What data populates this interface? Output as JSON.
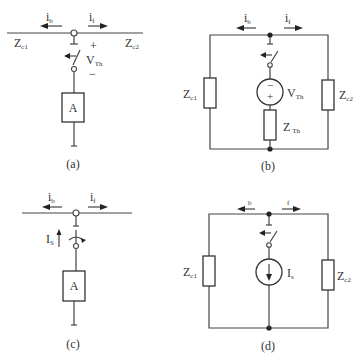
{
  "panels": {
    "a": {
      "caption": "(a)",
      "labels": {
        "ib": "i",
        "ib_sub": "b",
        "if": "i",
        "if_sub": "f",
        "zc1": "Z",
        "zc1_sub": "c1",
        "zc2": "Z",
        "zc2_sub": "c2",
        "vth": "V",
        "vth_sub": "Th",
        "plus": "+",
        "minus": "−",
        "box": "A"
      }
    },
    "b": {
      "caption": "(b)",
      "labels": {
        "ib": "i",
        "ib_sub": "b",
        "if": "i",
        "if_sub": "f",
        "zc1": "Z",
        "zc1_sub": "c1",
        "zc2": "Z",
        "zc2_sub": "c2",
        "vth": "V",
        "vth_sub": "Th",
        "zth": "Z",
        "zth_sub": "Th",
        "src_minus": "−",
        "src_plus": "+"
      }
    },
    "c": {
      "caption": "(c)",
      "labels": {
        "ib": "i",
        "ib_sub": "b",
        "if": "i",
        "if_sub": "f",
        "is": "I",
        "is_sub": "S",
        "box": "A"
      }
    },
    "d": {
      "caption": "(d)",
      "labels": {
        "ib_sub": "b",
        "if_sub": "f",
        "zc1": "Z",
        "zc1_sub": "c1",
        "zc2": "Z",
        "zc2_sub": "c2",
        "is": "I",
        "is_sub": "s"
      }
    }
  }
}
